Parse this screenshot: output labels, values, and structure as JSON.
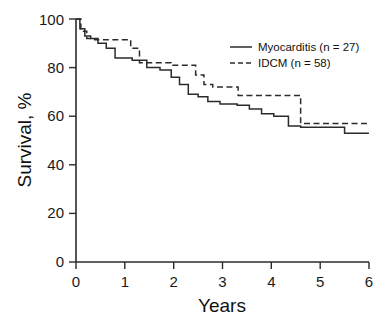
{
  "chart_data": {
    "type": "line",
    "title": "",
    "xlabel": "Years",
    "ylabel": "Survival, %",
    "xlim": [
      0,
      6
    ],
    "ylim": [
      0,
      100
    ],
    "xticks": [
      0,
      1,
      2,
      3,
      4,
      5,
      6
    ],
    "yticks": [
      0,
      20,
      40,
      60,
      80,
      100
    ],
    "xtick_labels": [
      "0",
      "1",
      "2",
      "3",
      "4",
      "5",
      "6"
    ],
    "ytick_labels": [
      "0",
      "20",
      "40",
      "60",
      "80",
      "100"
    ],
    "grid": false,
    "legend_position": "upper right",
    "step_style": "post",
    "series": [
      {
        "name": "Myocarditis (n = 27)",
        "legend_label": "Myocarditis (n = 27)",
        "style": "solid",
        "color": "#2b2b2b",
        "n": 27,
        "x": [
          0.0,
          0.08,
          0.18,
          0.3,
          0.45,
          0.62,
          0.8,
          1.15,
          1.45,
          1.72,
          1.95,
          2.12,
          2.3,
          2.5,
          2.7,
          2.95,
          3.3,
          3.55,
          3.8,
          4.05,
          4.35,
          4.6,
          5.5,
          6.0
        ],
        "y": [
          100.0,
          96.0,
          93.0,
          92.0,
          90.0,
          88.0,
          84.0,
          83.0,
          80.0,
          79.0,
          76.0,
          73.0,
          69.0,
          68.0,
          66.0,
          65.0,
          64.5,
          63.0,
          61.0,
          60.0,
          56.0,
          55.5,
          53.0,
          53.0
        ],
        "final_value": 53.0
      },
      {
        "name": "IDCM (n = 58)",
        "legend_label": "IDCM (n = 58)",
        "style": "dashed",
        "color": "#2b2b2b",
        "n": 58,
        "x": [
          0.0,
          0.1,
          0.22,
          0.38,
          1.12,
          1.3,
          1.95,
          2.45,
          2.62,
          2.8,
          3.32,
          4.38,
          4.6,
          6.0
        ],
        "y": [
          100.0,
          95.0,
          92.0,
          91.5,
          88.0,
          82.0,
          81.0,
          77.0,
          73.0,
          72.0,
          68.5,
          68.5,
          57.0,
          57.0
        ],
        "final_value": 57.0
      }
    ]
  },
  "legend": {
    "entries": [
      {
        "label": "Myocarditis (n = 27)",
        "style": "solid"
      },
      {
        "label": "IDCM (n = 58)",
        "style": "dashed"
      }
    ]
  },
  "axes": {
    "x_title": "Years",
    "y_title": "Survival, %"
  }
}
